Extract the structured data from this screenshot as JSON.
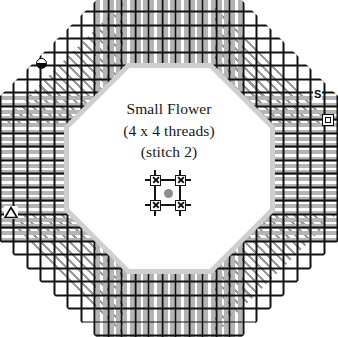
{
  "diagram": {
    "kind": "needlework-stitch-chart",
    "shape": "octagon",
    "title": "Small Flower",
    "subtitle": "(4 x 4 threads)",
    "note": "(stitch 2)",
    "grid": {
      "cell_px": 13.5,
      "line_color": "#111111",
      "background": "#ffffff"
    },
    "fills": [
      {
        "name": "diagonal-hatch",
        "region": "corner-wedges",
        "color": "#9a9a9a",
        "angle_deg": 45
      },
      {
        "name": "vertical-satin",
        "region": "top-and-bottom-edges",
        "color": "#b4b4b4",
        "angle_deg": 90
      },
      {
        "name": "horizontal-satin",
        "region": "left-and-right-edges",
        "color": "#b4b4b4",
        "angle_deg": 0
      }
    ],
    "center_motif": {
      "name": "small-flower",
      "arrangement": "2x2",
      "petal_count": 4,
      "center_dot_color": "#8d8d8d"
    },
    "markers": [
      {
        "id": "circle",
        "glyph": "half-filled-circle",
        "label": "",
        "position": "upper-left-edge",
        "color": "#0a0a0a"
      },
      {
        "id": "s",
        "glyph": "letter",
        "label": "S",
        "position": "right-upper-edge",
        "color": "#0a0a0a"
      },
      {
        "id": "square",
        "glyph": "outlined-square",
        "label": "",
        "position": "right-edge",
        "color": "#0a0a0a"
      },
      {
        "id": "triangle",
        "glyph": "outlined-triangle",
        "label": "",
        "position": "left-edge",
        "color": "#0a0a0a"
      }
    ]
  }
}
